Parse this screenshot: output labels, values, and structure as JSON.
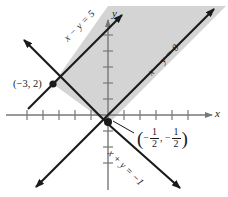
{
  "figure": {
    "type": "coordinate-graph",
    "background_color": "#ffffff",
    "shade_color": "#d4d4d4",
    "line_color": "#1a1a1a",
    "axis_color": "#777777"
  },
  "axes": {
    "x_label": "x",
    "y_label": "y",
    "x_range": [
      -7,
      6
    ],
    "y_range": [
      -4,
      5
    ],
    "tick_count_x": 13,
    "tick_count_y": 9,
    "grid": false
  },
  "lines": [
    {
      "id": "line-x-minus-y-5",
      "label": "x − y = 5",
      "equation_parts": {
        "lhs": "x − y",
        "rhs": "5"
      },
      "slope": 1,
      "intercept": 5,
      "style": "solid",
      "arrows": "both"
    },
    {
      "id": "line-x-minus-y-0",
      "label": "x − y = 0",
      "equation_parts": {
        "lhs": "x − y",
        "rhs": "0"
      },
      "slope": 1,
      "intercept": 0,
      "style": "solid",
      "arrows": "both"
    },
    {
      "id": "line-x-plus-y",
      "label": "x + y = −1",
      "equation_parts": {
        "lhs": "x + y",
        "rhs": "−1"
      },
      "slope": -1,
      "intercept": -1,
      "style": "solid",
      "arrows": "both"
    }
  ],
  "points": [
    {
      "id": "point-neg3-2",
      "label": "(−3, 2)",
      "x": -3,
      "y": 2,
      "marker": "filled-dot"
    },
    {
      "id": "point-half",
      "label_parts": {
        "open": "(",
        "minus1": "−",
        "num1": "1",
        "den1": "2",
        "comma": ",",
        "minus2": "−",
        "num2": "1",
        "den2": "2",
        "close": ")"
      },
      "label_plain": "(−1/2, −1/2)",
      "x": -0.5,
      "y": -0.5,
      "marker": "filled-dot",
      "has_leader_line": true
    }
  ],
  "shaded_region": {
    "description": "region between the parallel lines x − y = 5 and x − y = 0, above x + y = −1",
    "fill": "#d4d4d4",
    "vertices": [
      [
        -3,
        2
      ],
      [
        -0.5,
        -0.5
      ],
      [
        6,
        6
      ],
      [
        1,
        6
      ]
    ]
  }
}
